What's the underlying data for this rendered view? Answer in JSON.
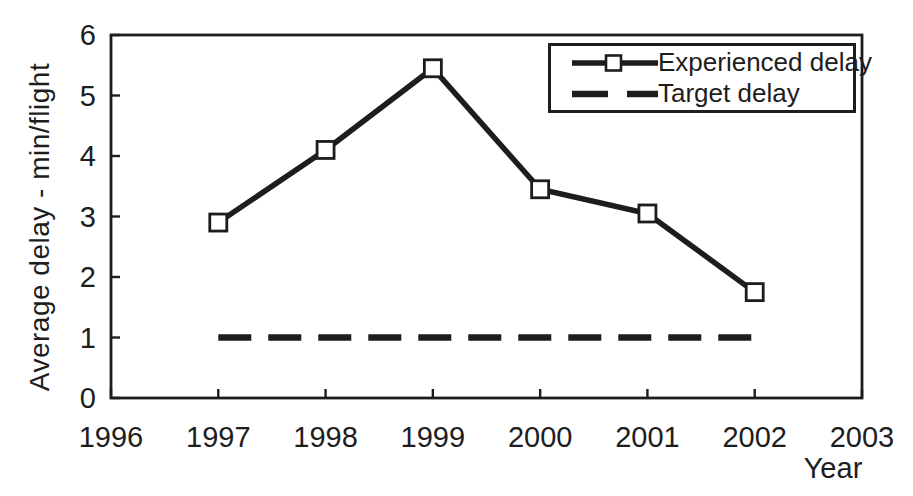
{
  "figure": {
    "x_axis_title": "Year",
    "y_axis_title": "Average delay - min/flight"
  },
  "colors": {
    "ink": "#1d1d1d",
    "background": "#ffffff",
    "marker_fill": "#ffffff"
  },
  "chart_data": {
    "type": "line",
    "x": [
      1997,
      1998,
      1999,
      2000,
      2001,
      2002
    ],
    "series": [
      {
        "name": "Experienced delay",
        "values": [
          2.9,
          4.1,
          5.45,
          3.45,
          3.05,
          1.75
        ],
        "line_style": "solid",
        "marker": "square"
      },
      {
        "name": "Target delay",
        "values": [
          1,
          1,
          1,
          1,
          1,
          1
        ],
        "line_style": "dashed",
        "marker": "none"
      }
    ],
    "title": "",
    "xlabel": "Year",
    "ylabel": "Average delay - min/flight",
    "xlim": [
      1996,
      2003
    ],
    "ylim": [
      0,
      6
    ],
    "x_ticks": [
      1996,
      1997,
      1998,
      1999,
      2000,
      2001,
      2002,
      2003
    ],
    "y_ticks": [
      0,
      1,
      2,
      3,
      4,
      5,
      6
    ],
    "grid": false,
    "legend_position": "top-right"
  }
}
